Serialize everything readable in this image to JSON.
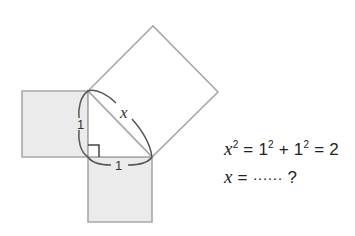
{
  "diagram": {
    "colors": {
      "square_fill": "#ebebeb",
      "square_stroke": "#a8a8a8",
      "triangle_stroke": "#a8a8a8",
      "brace_stroke": "#555555",
      "label_color": "#333333",
      "big_square_fill": "#ffffff"
    },
    "vertices": {
      "right_angle": [
        88,
        157
      ],
      "top": [
        88,
        91
      ],
      "right": [
        152,
        157
      ]
    },
    "squares": [
      {
        "name": "left-square",
        "side": "vertical leg",
        "points": [
          [
            22,
            91
          ],
          [
            88,
            91
          ],
          [
            88,
            157
          ],
          [
            22,
            157
          ]
        ],
        "shaded": true
      },
      {
        "name": "bottom-square",
        "side": "horizontal leg",
        "points": [
          [
            88,
            157
          ],
          [
            152,
            157
          ],
          [
            152,
            222
          ],
          [
            88,
            222
          ]
        ],
        "shaded": true
      },
      {
        "name": "hypotenuse-square",
        "side": "hypotenuse",
        "points": [
          [
            88,
            91
          ],
          [
            153,
            26
          ],
          [
            218,
            92
          ],
          [
            152,
            157
          ]
        ],
        "shaded": false
      }
    ],
    "labels": {
      "vertical_leg": "1",
      "horizontal_leg": "1",
      "hypotenuse": "x"
    }
  },
  "equations": {
    "line1": {
      "var": "x",
      "exp": "2",
      "rest_a": " = 1",
      "exp_a": "2",
      "rest_b": " + 1",
      "exp_b": "2",
      "rest_c": " = 2"
    },
    "line2": {
      "var": "x",
      "eq": " = ",
      "dots": "······",
      "q": " ?"
    }
  }
}
